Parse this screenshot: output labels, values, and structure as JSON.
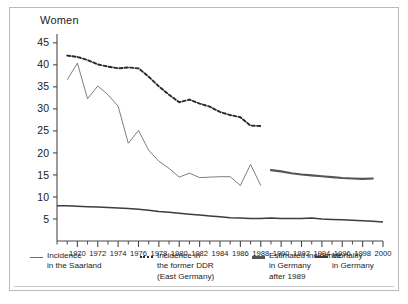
{
  "figure": {
    "title": "Women",
    "border_color": "#b9b9b9"
  },
  "chart_data": {
    "type": "line",
    "title": "Women",
    "xlabel": "",
    "ylabel": "",
    "xlim": [
      1968,
      2000
    ],
    "ylim": [
      0,
      47
    ],
    "yticks": [
      5,
      10,
      15,
      20,
      25,
      30,
      35,
      40,
      45
    ],
    "xticks": [
      1970,
      1972,
      1974,
      1976,
      1978,
      1980,
      1982,
      1984,
      1986,
      1988,
      1990,
      1992,
      1994,
      1996,
      1998,
      2000
    ],
    "xtick_minor_step": 1,
    "grid": false,
    "legend_position": "below-axes",
    "series": [
      {
        "name": "Incidence in the Saarland",
        "style": "thin-solid",
        "color": "#6e6e6e",
        "x": [
          1969,
          1970,
          1971,
          1972,
          1973,
          1974,
          1975,
          1976,
          1977,
          1978,
          1979,
          1980,
          1981,
          1982,
          1983,
          1984,
          1985,
          1986,
          1987,
          1988
        ],
        "values": [
          36.6,
          40.4,
          32.3,
          35.2,
          33.2,
          30.6,
          22.2,
          25.1,
          20.6,
          18.1,
          16.5,
          14.5,
          15.4,
          14.4,
          14.5,
          14.6,
          14.6,
          12.6,
          17.4,
          12.6
        ]
      },
      {
        "name": "Incidence in the former DDR (East Germany)",
        "style": "dashed",
        "color": "#2a2a2a",
        "x": [
          1969,
          1970,
          1971,
          1972,
          1973,
          1974,
          1975,
          1976,
          1977,
          1978,
          1979,
          1980,
          1981,
          1982,
          1983,
          1984,
          1985,
          1986,
          1987,
          1988
        ],
        "values": [
          42.1,
          41.8,
          41.1,
          40.1,
          39.6,
          39.2,
          39.4,
          39.2,
          37.3,
          35.1,
          33.2,
          31.5,
          32.1,
          31.2,
          30.5,
          29.3,
          28.6,
          28.1,
          26.2,
          26.1
        ]
      },
      {
        "name": "Estimated incidence in Germany after 1989",
        "style": "thick-solid",
        "color": "#555555",
        "x": [
          1989,
          1990,
          1991,
          1992,
          1993,
          1994,
          1995,
          1996,
          1997,
          1998,
          1999
        ],
        "values": [
          16.1,
          15.8,
          15.4,
          15.1,
          14.9,
          14.7,
          14.5,
          14.3,
          14.2,
          14.1,
          14.2
        ]
      },
      {
        "name": "Mortality in Germany",
        "style": "solid",
        "color": "#3d3d3d",
        "x": [
          1968,
          1969,
          1970,
          1971,
          1972,
          1973,
          1974,
          1975,
          1976,
          1977,
          1978,
          1979,
          1980,
          1981,
          1982,
          1983,
          1984,
          1985,
          1986,
          1987,
          1988,
          1989,
          1990,
          1991,
          1992,
          1993,
          1994,
          1995,
          1996,
          1997,
          1998,
          1999,
          2000
        ],
        "values": [
          8.0,
          8.0,
          7.9,
          7.8,
          7.7,
          7.6,
          7.5,
          7.4,
          7.2,
          7.0,
          6.7,
          6.5,
          6.3,
          6.1,
          5.9,
          5.7,
          5.5,
          5.3,
          5.2,
          5.1,
          5.1,
          5.2,
          5.1,
          5.1,
          5.1,
          5.2,
          5.0,
          4.9,
          4.8,
          4.7,
          4.6,
          4.5,
          4.3
        ]
      }
    ]
  },
  "legend": {
    "items": [
      {
        "marker": "thin-solid-marker",
        "label": "Incidence\nin the Saarland"
      },
      {
        "marker": "dotted-marker",
        "label": "Incidence in\nthe former DDR\n(East Germany)"
      },
      {
        "marker": "thick-bar-marker",
        "label": "Estimated incidence\nin Germany\nafter 1989"
      },
      {
        "marker": "mortality-marker",
        "label": "Mortality\nin Germany"
      }
    ]
  }
}
